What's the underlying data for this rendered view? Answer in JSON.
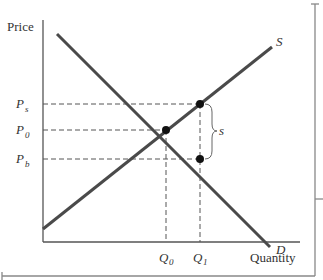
{
  "diagram": {
    "type": "supply-demand-tax-wedge",
    "axis": {
      "y_label": "Price",
      "x_label": "Quantity"
    },
    "curves": [
      {
        "name": "supply",
        "label": "S",
        "from": [
          43,
          229
        ],
        "to": [
          272,
          47
        ]
      },
      {
        "name": "demand",
        "label": "D",
        "from": [
          57,
          34
        ],
        "to": [
          270,
          247
        ]
      }
    ],
    "price_levels": [
      {
        "id": "ps",
        "label": "P",
        "sub": "s",
        "y": 104
      },
      {
        "id": "p0",
        "label": "P",
        "sub": "0",
        "y": 130
      },
      {
        "id": "pb",
        "label": "P",
        "sub": "b",
        "y": 159
      }
    ],
    "quantity_levels": [
      {
        "id": "q0",
        "label": "Q",
        "sub": "0",
        "x": 166
      },
      {
        "id": "q1",
        "label": "Q",
        "sub": "1",
        "x": 200
      }
    ],
    "points": [
      {
        "name": "equilibrium",
        "x": 166,
        "y": 130
      },
      {
        "name": "seller-price-point",
        "x": 200,
        "y": 104
      },
      {
        "name": "buyer-price-point",
        "x": 200,
        "y": 159
      }
    ],
    "brace": {
      "label": "s",
      "meaning": "subsidy wedge between Ps and Pb"
    },
    "colors": {
      "curve": "#4a4a4a",
      "axis": "#555555",
      "dash": "#555555",
      "point": "#111111",
      "frame": "#888888"
    }
  }
}
